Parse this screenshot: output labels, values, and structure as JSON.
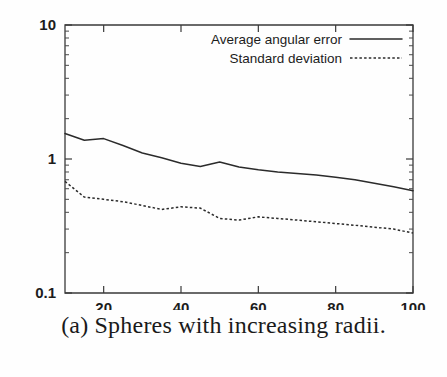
{
  "figure": {
    "caption": "(a) Spheres with increasing radii."
  },
  "chart_data": {
    "type": "line",
    "title": "",
    "xlabel": "",
    "ylabel": "",
    "yscale": "log",
    "xscale": "linear",
    "xlim": [
      10,
      100
    ],
    "ylim": [
      0.1,
      10
    ],
    "grid": false,
    "legend_position": "top-right",
    "xticks": [
      20,
      40,
      60,
      80,
      100
    ],
    "xtick_labels": [
      "20",
      "40",
      "60",
      "80",
      "100"
    ],
    "yticks": [
      0.1,
      1,
      10
    ],
    "ytick_labels": [
      "0.1",
      "1",
      "10"
    ],
    "yminor_ticks": [
      0.2,
      0.3,
      0.4,
      0.5,
      0.6,
      0.7,
      0.8,
      0.9,
      2,
      3,
      4,
      5,
      6,
      7,
      8,
      9
    ],
    "series": [
      {
        "name": "Average angular error",
        "style": "solid",
        "color": "#2b2b2b",
        "x": [
          10,
          15,
          20,
          25,
          30,
          35,
          40,
          45,
          50,
          55,
          60,
          65,
          70,
          75,
          80,
          85,
          90,
          95,
          100
        ],
        "values": [
          1.55,
          1.38,
          1.42,
          1.26,
          1.11,
          1.02,
          0.93,
          0.88,
          0.95,
          0.87,
          0.83,
          0.8,
          0.78,
          0.76,
          0.73,
          0.7,
          0.66,
          0.62,
          0.58
        ]
      },
      {
        "name": "Standard deviation",
        "style": "dashed",
        "color": "#2b2b2b",
        "x": [
          10,
          15,
          20,
          25,
          30,
          35,
          40,
          45,
          50,
          55,
          60,
          65,
          70,
          75,
          80,
          85,
          90,
          95,
          100
        ],
        "values": [
          0.68,
          0.52,
          0.5,
          0.48,
          0.45,
          0.42,
          0.44,
          0.43,
          0.36,
          0.35,
          0.37,
          0.36,
          0.35,
          0.34,
          0.33,
          0.32,
          0.31,
          0.3,
          0.28
        ]
      }
    ]
  },
  "legend": {
    "entries": [
      {
        "label": "Average angular error",
        "style": "solid"
      },
      {
        "label": "Standard deviation",
        "style": "dashed"
      }
    ]
  }
}
